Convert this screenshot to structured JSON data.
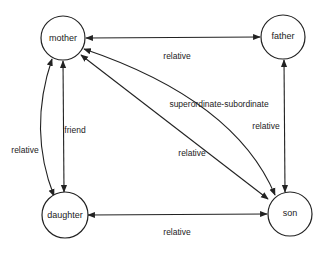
{
  "diagram": {
    "type": "relationship-graph",
    "nodes": [
      {
        "id": "mother",
        "label": "mother"
      },
      {
        "id": "father",
        "label": "father"
      },
      {
        "id": "daughter",
        "label": "daughter"
      },
      {
        "id": "son",
        "label": "son"
      }
    ],
    "edges": [
      {
        "id": "mother-father",
        "source": "mother",
        "target": "father",
        "label": "relative",
        "direction": "both"
      },
      {
        "id": "mother-son-relative",
        "source": "mother",
        "target": "son",
        "label": "relative",
        "direction": "both"
      },
      {
        "id": "mother-son-superordinate",
        "source": "mother",
        "target": "son",
        "label": "superordinate-subordinate",
        "direction": "both"
      },
      {
        "id": "father-son",
        "source": "father",
        "target": "son",
        "label": "relative",
        "direction": "both"
      },
      {
        "id": "mother-daughter-friend",
        "source": "mother",
        "target": "daughter",
        "label": "friend",
        "direction": "both"
      },
      {
        "id": "mother-daughter-relative",
        "source": "mother",
        "target": "daughter",
        "label": "relative",
        "direction": "both"
      },
      {
        "id": "daughter-son",
        "source": "daughter",
        "target": "son",
        "label": "relative",
        "direction": "both"
      }
    ]
  }
}
